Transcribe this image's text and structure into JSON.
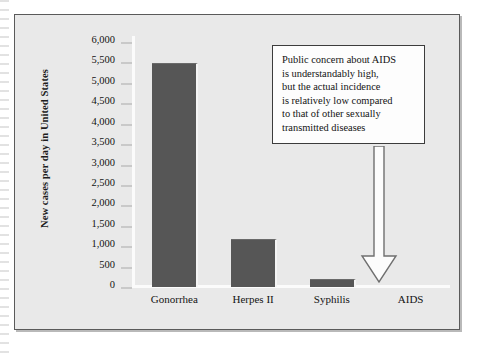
{
  "figure": {
    "y_axis_title": "New cases per day in United States"
  },
  "callout": {
    "lines": [
      "Public concern about AIDS",
      "is understandably high,",
      "but the actual incidence",
      "is relatively low compared",
      "to that of other sexually",
      "transmitted diseases"
    ],
    "arrow_icon": "down-arrow-outline-icon",
    "arrow_points_to": "AIDS"
  },
  "colors": {
    "bar": "#565656",
    "plot_background": "#e9e9e9",
    "frame_border": "#5a5a5a",
    "callout_border": "#3c3c3c",
    "callout_fill": "#fdfdfd",
    "axis_rail": "#fbfbfb",
    "tick_mark": "#c9c9c9",
    "text": "#131313"
  },
  "chart_data": {
    "type": "bar",
    "title": "",
    "xlabel": "",
    "ylabel": "New cases per day in United States",
    "categories": [
      "Gonorrhea",
      "Herpes II",
      "Syphilis",
      "AIDS"
    ],
    "values": [
      5450,
      1150,
      175,
      0
    ],
    "ylim": [
      0,
      6000
    ],
    "ytick_values": [
      0,
      500,
      1000,
      1500,
      2000,
      2500,
      3000,
      3500,
      4000,
      4500,
      5000,
      5500,
      6000
    ],
    "ytick_labels": [
      "0",
      "500",
      "1,000",
      "1,500",
      "2,000",
      "2,500",
      "3,000",
      "3,500",
      "4,000",
      "4,500",
      "5,000",
      "5,500",
      "6,000"
    ],
    "grid": false,
    "legend": false,
    "annotations": [
      {
        "text": "Public concern about AIDS is understandably high, but the actual incidence is relatively low compared to that of other sexually transmitted diseases",
        "target": "AIDS"
      }
    ]
  }
}
